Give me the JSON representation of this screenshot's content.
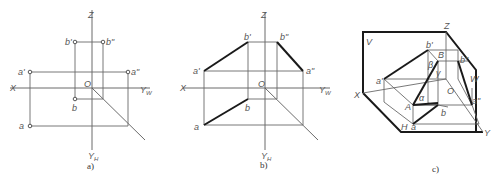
{
  "figures": [
    {
      "id": "a",
      "caption": "a)",
      "axes": {
        "z": "Z",
        "x": "X",
        "yw": "Y",
        "yw_sub": "W",
        "yh": "Y",
        "yh_sub": "H",
        "origin": "O"
      },
      "points": {
        "a_front": "a'",
        "a_side": "a\"",
        "a_top": "a",
        "b_front": "b'",
        "b_side": "b\"",
        "b_top": "b"
      }
    },
    {
      "id": "b",
      "caption": "b)",
      "axes": {
        "z": "Z",
        "x": "X",
        "yw": "Y",
        "yw_sub": "W",
        "yh": "Y",
        "yh_sub": "H",
        "origin": "O"
      },
      "points": {
        "a_front": "a'",
        "a_side": "a\"",
        "a_top": "a",
        "b_front": "b'",
        "b_side": "b\"",
        "b_top": "b"
      }
    },
    {
      "id": "c",
      "caption": "c)",
      "planes": {
        "v": "V",
        "w": "W",
        "h": "H"
      },
      "axes": {
        "z": "Z",
        "x": "X",
        "y": "Y",
        "origin": "O"
      },
      "points": {
        "a_front": "a'",
        "a_side": "a\"",
        "a_top": "a",
        "b_front": "b'",
        "b_side": "b\"",
        "b_top": "b",
        "A": "A",
        "B": "B"
      },
      "angles": {
        "alpha": "α",
        "beta": "β",
        "gamma": "γ"
      }
    }
  ]
}
